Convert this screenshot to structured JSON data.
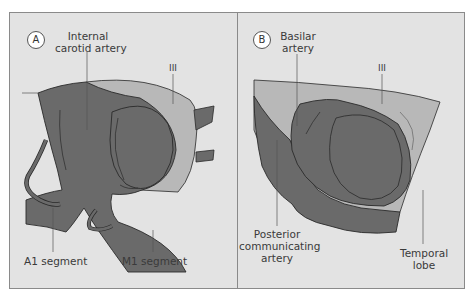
{
  "figure": {
    "panels": [
      {
        "id": "A",
        "badge": "A",
        "labels": {
          "ica_line1": "Internal",
          "ica_line2": "carotid artery",
          "cn3": "III",
          "a1": "A1 segment",
          "m1": "M1 segment"
        }
      },
      {
        "id": "B",
        "badge": "B",
        "labels": {
          "basilar_line1": "Basilar",
          "basilar_line2": "artery",
          "cn3": "III",
          "pcom_line1": "Posterior",
          "pcom_line2": "communicating",
          "pcom_line3": "artery",
          "temporal_line1": "Temporal",
          "temporal_line2": "lobe"
        }
      }
    ],
    "colors": {
      "background": "#e3e3e3",
      "border": "#8a8a8a",
      "artery_dark": "#6a6a6a",
      "nerve_light": "#b8b8b8",
      "outline": "#2a2a2a",
      "label_text": "#3a3a3a"
    }
  }
}
